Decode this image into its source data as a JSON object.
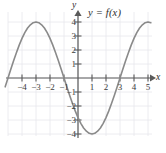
{
  "figure": {
    "width": 166,
    "height": 153,
    "background": "#ffffff"
  },
  "chart_data": {
    "type": "line",
    "title": "",
    "subtitle": "",
    "xlabel": "x",
    "ylabel": "y",
    "annotations": [
      {
        "text": "y = f(x)",
        "x": 1.0,
        "y": 4.9
      }
    ],
    "legend": [],
    "legend_position": "none",
    "grid": true,
    "grid_color": "#e6e6ea",
    "grid_step_x": 1,
    "grid_step_y": 1,
    "axis_color": "#555555",
    "curve_color": "#8a8a8a",
    "curve_width": 1.6,
    "xlim": [
      -5.2,
      5.3
    ],
    "ylim": [
      -4.8,
      4.9
    ],
    "xticks": [
      -4,
      -3,
      -2,
      -1,
      1,
      2,
      3,
      4,
      5
    ],
    "xtick_labels": [
      "−4",
      "−3",
      "−2",
      "−1",
      "1",
      "2",
      "3",
      "4",
      "5"
    ],
    "yticks": [
      -4,
      -3,
      -2,
      -1,
      1,
      2,
      3,
      4
    ],
    "ytick_labels": [
      "−4",
      "−3",
      "−2",
      "−1",
      "1",
      "2",
      "3",
      "4"
    ],
    "function": "f(x) = 4 cos(pi x / 2)",
    "amplitude": 4,
    "period": 4,
    "maxima": [
      {
        "x": -4,
        "y": 4
      },
      {
        "x": 0,
        "y": 4
      },
      {
        "x": 4,
        "y": 4
      }
    ],
    "minima": [
      {
        "x": -2,
        "y": -4
      },
      {
        "x": 2,
        "y": -4
      }
    ],
    "zeros": [
      -5,
      -3,
      -1,
      1,
      3,
      5
    ],
    "x": [
      -5.2,
      -5.0,
      -4.8,
      -4.6,
      -4.4,
      -4.2,
      -4.0,
      -3.8,
      -3.6,
      -3.4,
      -3.2,
      -3.0,
      -2.8,
      -2.6,
      -2.4,
      -2.2,
      -2.0,
      -1.8,
      -1.6,
      -1.4,
      -1.2,
      -1.0,
      -0.8,
      -0.6,
      -0.4,
      -0.2,
      0.0,
      0.2,
      0.4,
      0.6,
      0.8,
      1.0,
      1.2,
      1.4,
      1.6,
      1.8,
      2.0,
      2.2,
      2.4,
      2.6,
      2.8,
      3.0,
      3.2,
      3.4,
      3.6,
      3.8,
      4.0,
      4.2,
      4.4,
      4.6,
      4.8,
      5.0,
      5.2
    ],
    "y": [
      -0.63,
      0.0,
      0.63,
      1.24,
      1.81,
      2.35,
      2.83,
      3.24,
      3.57,
      3.8,
      3.95,
      4.0,
      3.95,
      3.8,
      3.57,
      3.24,
      2.83,
      2.35,
      1.81,
      1.24,
      0.63,
      0.0,
      -0.63,
      -1.24,
      -1.81,
      -2.35,
      -2.83,
      -3.24,
      -3.57,
      -3.8,
      -3.95,
      -4.0,
      -3.95,
      -3.8,
      -3.57,
      -3.24,
      -2.83,
      -2.35,
      -1.81,
      -1.24,
      -0.63,
      0.0,
      0.63,
      1.24,
      1.81,
      2.35,
      2.83,
      3.24,
      3.57,
      3.8,
      3.95,
      4.0,
      3.95
    ]
  },
  "labels": {
    "equation": "y = f(x)",
    "x_axis_name": "x",
    "y_axis_name": "y",
    "x_neg4": "−4",
    "x_neg3": "−3",
    "x_neg2": "−2",
    "x_neg1": "−1",
    "x_1": "1",
    "x_2": "2",
    "x_3": "3",
    "x_4": "4",
    "x_5": "5",
    "y_4": "4",
    "y_3": "3",
    "y_2": "2",
    "y_1": "1",
    "y_neg1": "−1",
    "y_neg2": "−2",
    "y_neg3": "−3",
    "y_neg4": "−4"
  }
}
